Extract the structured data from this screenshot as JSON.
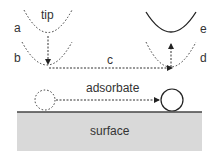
{
  "labels": {
    "tip": "tip",
    "a": "a",
    "b": "b",
    "c": "c",
    "d": "d",
    "e": "e",
    "adsorbate": "adsorbate",
    "surface": "surface"
  },
  "colors": {
    "line": "#222222",
    "surface_fill": "#d9d9d9",
    "surface_edge": "#444444"
  }
}
